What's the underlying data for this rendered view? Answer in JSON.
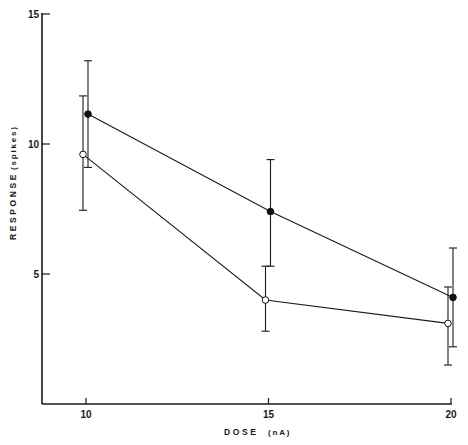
{
  "chart_data": {
    "type": "line",
    "title": "",
    "xlabel": "DOSE",
    "xlabel_unit": "(nA)",
    "ylabel": "RESPONSE",
    "ylabel_unit": "(spikes)",
    "x": [
      10,
      15,
      20
    ],
    "xticks": [
      10,
      15,
      20
    ],
    "xtick_labels": [
      "10",
      "15",
      "20"
    ],
    "yticks": [
      5,
      10,
      15
    ],
    "ytick_labels": [
      "5",
      "10",
      "15"
    ],
    "xlim": [
      8.8,
      20
    ],
    "ylim": [
      0,
      15
    ],
    "grid": false,
    "legend": null,
    "series": [
      {
        "name": "filled-circles",
        "marker": "filled",
        "values": [
          11.15,
          7.4,
          4.1
        ],
        "err_upper": [
          13.2,
          9.4,
          6.0
        ],
        "err_lower": [
          9.1,
          5.3,
          2.2
        ]
      },
      {
        "name": "open-circles",
        "marker": "open",
        "values": [
          9.6,
          4.0,
          3.1
        ],
        "err_upper": [
          11.85,
          5.3,
          4.5
        ],
        "err_lower": [
          7.45,
          2.8,
          1.5
        ]
      }
    ]
  }
}
